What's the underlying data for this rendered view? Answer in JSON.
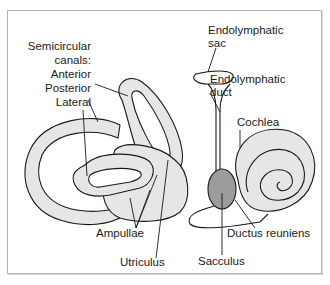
{
  "figure": {
    "colors": {
      "structure_fill": "#e6e6e6",
      "sacculus_fill": "#9c9c9c",
      "stroke": "#1a1a1a",
      "frame": "#b5b5b5"
    },
    "labels": {
      "semicircular_line1": "Semicircular",
      "semicircular_line2": "canals:",
      "anterior": "Anterior",
      "posterior": "Posterior",
      "lateral": "Lateral",
      "endolymphatic_sac_line1": "Endolymphatic",
      "endolymphatic_sac_line2": "sac",
      "endolymphatic_duct_line1": "Endolymphatic",
      "endolymphatic_duct_line2": "duct",
      "cochlea": "Cochlea",
      "ampullae": "Ampullae",
      "utriculus": "Utriculus",
      "sacculus": "Sacculus",
      "ductus_reuniens": "Ductus reuniens"
    }
  }
}
